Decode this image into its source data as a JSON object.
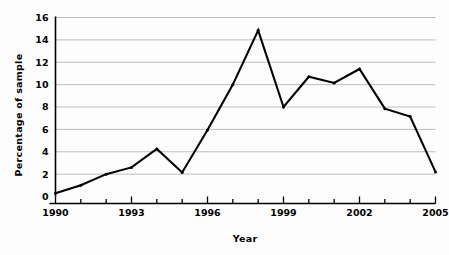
{
  "chart_data": {
    "type": "line",
    "title": "",
    "xlabel": "Year",
    "ylabel": "Percentage of sample",
    "x": [
      1990,
      1991,
      1992,
      1993,
      1994,
      1995,
      1996,
      1997,
      1998,
      1999,
      2000,
      2001,
      2002,
      2003,
      2004,
      2005
    ],
    "values": [
      0.3,
      1.0,
      2.0,
      2.6,
      4.25,
      2.15,
      5.95,
      10.0,
      14.85,
      8.0,
      10.7,
      10.15,
      11.4,
      7.85,
      7.15,
      2.2
    ],
    "series": [
      {
        "name": "Percentage of sample",
        "values": [
          0.3,
          1.0,
          2.0,
          2.6,
          4.25,
          2.15,
          5.95,
          10.0,
          14.85,
          8.0,
          10.7,
          10.15,
          11.4,
          7.85,
          7.15,
          2.2
        ]
      }
    ],
    "xlim": [
      1990,
      2005
    ],
    "ylim": [
      0,
      16
    ],
    "yticks": [
      0,
      2,
      4,
      6,
      8,
      10,
      12,
      14,
      16
    ],
    "ytick_labels": [
      "0",
      "2",
      "4",
      "6",
      "8",
      "10",
      "12",
      "14",
      "16"
    ],
    "xticks": [
      1990,
      1991,
      1992,
      1993,
      1994,
      1995,
      1996,
      1997,
      1998,
      1999,
      2000,
      2001,
      2002,
      2003,
      2004,
      2005
    ],
    "xtick_labels_major": [
      "1990",
      "1993",
      "1996",
      "1999",
      "2002",
      "2005"
    ],
    "xticks_major": [
      1990,
      1993,
      1996,
      1999,
      2002,
      2005
    ],
    "grid": "horizontal",
    "legend": "none",
    "line_color": "#000000",
    "grid_color": "#b5b5b5",
    "axis_color": "#000000",
    "marker": "dot"
  }
}
